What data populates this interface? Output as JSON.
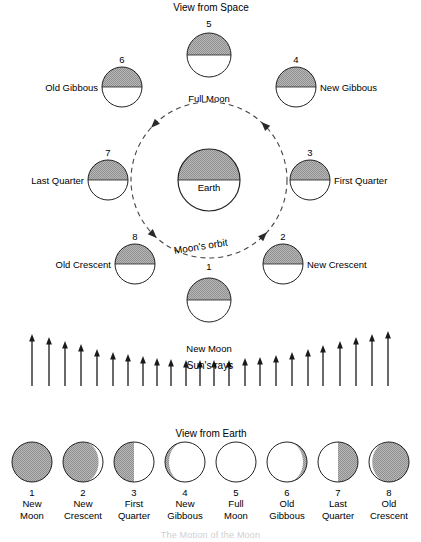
{
  "diagram": {
    "title_space": "View from Space",
    "title_earth": "View from Earth",
    "earth_label": "Earth",
    "orbit_label": "Moon's orbit",
    "rays_label": "Sun's rays",
    "footer_partial": "The Motion of the Moon",
    "colors": {
      "shade_gray": "#a8a8a8",
      "outline": "#222222",
      "orbit_dash": "#444444",
      "arrow": "#1a1a1a",
      "white": "#ffffff"
    }
  },
  "space_view": {
    "moons": [
      {
        "num": "1",
        "label": "New Moon",
        "cx": 209,
        "cy": 300,
        "r": 22,
        "label_x": 209,
        "label_y": 327,
        "label_align": "center",
        "num_x": 209,
        "num_y": 266
      },
      {
        "num": "2",
        "label": "New Crescent",
        "cx": 283,
        "cy": 264,
        "r": 20,
        "label_x": 307,
        "label_y": 264,
        "label_align": "left",
        "num_x": 283,
        "num_y": 236
      },
      {
        "num": "3",
        "label": "First Quarter",
        "cx": 310,
        "cy": 180,
        "r": 20,
        "label_x": 334,
        "label_y": 180,
        "label_align": "left",
        "num_x": 310,
        "num_y": 152
      },
      {
        "num": "4",
        "label": "New Gibbous",
        "cx": 296,
        "cy": 87,
        "r": 20,
        "label_x": 320,
        "label_y": 87,
        "label_align": "left",
        "num_x": 296,
        "num_y": 59
      },
      {
        "num": "5",
        "label": "Full Moon",
        "cx": 209,
        "cy": 55,
        "r": 22,
        "label_x": 209,
        "label_y": 77,
        "label_align": "center",
        "num_x": 209,
        "num_y": 23
      },
      {
        "num": "6",
        "label": "Old Gibbous",
        "cx": 122,
        "cy": 87,
        "r": 20,
        "label_x": 98,
        "label_y": 87,
        "label_align": "right",
        "num_x": 122,
        "num_y": 59
      },
      {
        "num": "7",
        "label": "Last Quarter",
        "cx": 108,
        "cy": 180,
        "r": 20,
        "label_x": 84,
        "label_y": 180,
        "label_align": "right",
        "num_x": 108,
        "num_y": 152
      },
      {
        "num": "8",
        "label": "Old Crescent",
        "cx": 135,
        "cy": 264,
        "r": 20,
        "label_x": 111,
        "label_y": 264,
        "label_align": "right",
        "num_x": 135,
        "num_y": 236
      }
    ],
    "earth": {
      "cx": 209,
      "cy": 180,
      "r": 31
    },
    "orbit": {
      "cx": 209,
      "cy": 180,
      "r": 78
    }
  },
  "sun_rays": {
    "baseline_y": 386,
    "arrows": [
      {
        "x": 32,
        "top": 334
      },
      {
        "x": 49,
        "top": 337
      },
      {
        "x": 65,
        "top": 341
      },
      {
        "x": 81,
        "top": 344
      },
      {
        "x": 97,
        "top": 349
      },
      {
        "x": 113,
        "top": 352
      },
      {
        "x": 128,
        "top": 354
      },
      {
        "x": 143,
        "top": 356
      },
      {
        "x": 157,
        "top": 358
      },
      {
        "x": 171,
        "top": 359
      },
      {
        "x": 186,
        "top": 360
      },
      {
        "x": 200,
        "top": 360
      },
      {
        "x": 214,
        "top": 360
      },
      {
        "x": 229,
        "top": 360
      },
      {
        "x": 245,
        "top": 358
      },
      {
        "x": 260,
        "top": 357
      },
      {
        "x": 276,
        "top": 355
      },
      {
        "x": 292,
        "top": 352
      },
      {
        "x": 308,
        "top": 349
      },
      {
        "x": 323,
        "top": 345
      },
      {
        "x": 340,
        "top": 341
      },
      {
        "x": 356,
        "top": 337
      },
      {
        "x": 372,
        "top": 334
      },
      {
        "x": 388,
        "top": 331
      }
    ],
    "masked_arrows_x": [
      186,
      200,
      214,
      229
    ]
  },
  "earth_view": {
    "phases": [
      {
        "num": "1",
        "name_line1": "New",
        "name_line2": "Moon",
        "cx": 32,
        "type": "full-dark"
      },
      {
        "num": "2",
        "name_line1": "New",
        "name_line2": "Crescent",
        "cx": 83,
        "type": "waning-gibbous-right-sliver"
      },
      {
        "num": "3",
        "name_line1": "First",
        "name_line2": "Quarter",
        "cx": 134,
        "type": "left-half-dark"
      },
      {
        "num": "4",
        "name_line1": "New",
        "name_line2": "Gibbous",
        "cx": 185,
        "type": "left-sliver-dark"
      },
      {
        "num": "5",
        "name_line1": "Full",
        "name_line2": "Moon",
        "cx": 236,
        "type": "full-light"
      },
      {
        "num": "6",
        "name_line1": "Old",
        "name_line2": "Gibbous",
        "cx": 287,
        "type": "right-sliver-dark"
      },
      {
        "num": "7",
        "name_line1": "Last",
        "name_line2": "Quarter",
        "cx": 338,
        "type": "right-half-dark"
      },
      {
        "num": "8",
        "name_line1": "Old",
        "name_line2": "Crescent",
        "cx": 389,
        "type": "left-sliver-light"
      }
    ],
    "circle_cy": 462,
    "circle_r": 20,
    "num_y": 492,
    "name_y": 503
  }
}
